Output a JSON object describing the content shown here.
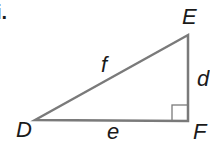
{
  "problem_label": "i.",
  "diagram": {
    "type": "right-triangle",
    "vertices": {
      "D": {
        "label": "D",
        "x": 35,
        "y": 120
      },
      "E": {
        "label": "E",
        "x": 188,
        "y": 35
      },
      "F": {
        "label": "F",
        "x": 188,
        "y": 121
      }
    },
    "sides": {
      "f": {
        "label": "f",
        "between": [
          "D",
          "E"
        ]
      },
      "d": {
        "label": "d",
        "between": [
          "E",
          "F"
        ]
      },
      "e": {
        "label": "e",
        "between": [
          "D",
          "F"
        ]
      }
    },
    "right_angle_at": "F",
    "stroke_color": "#7a7a7a"
  }
}
